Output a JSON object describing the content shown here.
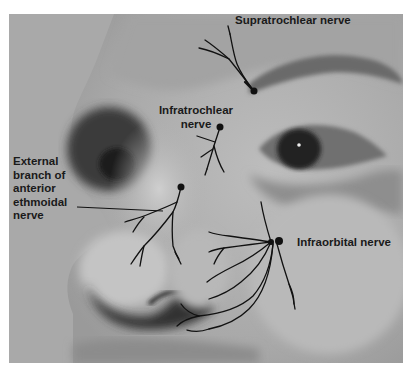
{
  "figure": {
    "labels": {
      "supratrochlear": "Supratrochlear nerve",
      "infratrochlear": "Infratrochlear\nnerve",
      "external_nasal": "External\nbranch of\nanterior\nethmoidal\nnerve",
      "infraorbital": "Infraorbital nerve"
    },
    "colors": {
      "background_wall": "#a8a8a8",
      "skin": "#b4b4b4",
      "nerve_line": "#111111",
      "label_text": "#1a1a1a"
    }
  }
}
